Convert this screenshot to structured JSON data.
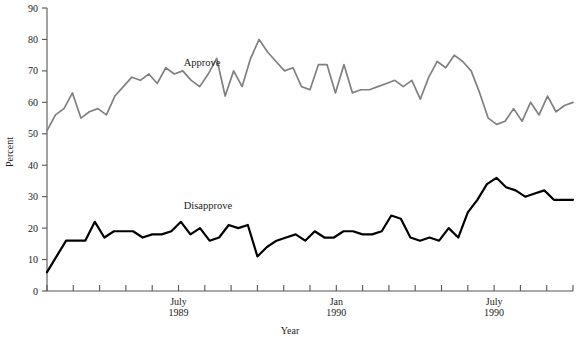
{
  "chart_data": {
    "type": "line",
    "title": "",
    "xlabel": "Year",
    "ylabel": "Percent",
    "ylim": [
      0,
      90
    ],
    "ytick_values": [
      0,
      10,
      20,
      30,
      40,
      50,
      60,
      70,
      80,
      90
    ],
    "ytick_labels": [
      "0",
      "10",
      "20",
      "30",
      "40",
      "50",
      "60",
      "70",
      "80",
      "90"
    ],
    "grid": false,
    "legend_position": "inline-annotations",
    "xtick_count": 21,
    "xtick_labels": [
      {
        "index": 5,
        "line1": "July",
        "line2": "1989"
      },
      {
        "index": 11,
        "line1": "Jan",
        "line2": "1990"
      },
      {
        "index": 17,
        "line1": "July",
        "line2": "1990"
      }
    ],
    "annotations": [
      {
        "text": "Approve",
        "x_index": 5.2,
        "y_value": 71.5
      },
      {
        "text": "Disapprove",
        "x_index": 5.2,
        "y_value": 26.0
      }
    ],
    "series": [
      {
        "name": "Approve",
        "color": "#808080",
        "values": [
          51,
          56,
          58,
          63,
          55,
          57,
          58,
          56,
          62,
          65,
          68,
          67,
          69,
          66,
          71,
          69,
          70,
          67,
          65,
          69,
          74,
          62,
          70,
          65,
          74,
          80,
          76,
          73,
          70,
          71,
          65,
          64,
          72,
          72,
          63,
          72,
          63,
          64,
          64,
          65,
          66,
          67,
          65,
          67,
          61,
          68,
          73,
          71,
          75,
          73,
          70,
          63,
          55,
          53,
          54,
          58,
          54,
          60,
          56,
          62,
          57,
          59,
          60
        ]
      },
      {
        "name": "Disapprove",
        "color": "#000000",
        "values": [
          6,
          11,
          16,
          16,
          16,
          22,
          17,
          19,
          19,
          19,
          17,
          18,
          18,
          19,
          22,
          18,
          20,
          16,
          17,
          21,
          20,
          21,
          11,
          14,
          16,
          17,
          18,
          16,
          19,
          17,
          17,
          19,
          19,
          18,
          18,
          19,
          24,
          23,
          17,
          16,
          17,
          16,
          20,
          17,
          25,
          29,
          34,
          36,
          33,
          32,
          30,
          31,
          32,
          29,
          29,
          29
        ]
      }
    ]
  },
  "axes": {
    "y_axis_title": "Percent",
    "x_axis_title": "Year"
  }
}
